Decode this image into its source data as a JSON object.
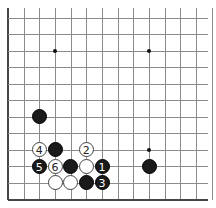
{
  "board": {
    "visible_region": "lower-left corner of 19x19 board",
    "cols_visible": 13,
    "rows_visible": 12,
    "first_row": 7,
    "origin_x": 8,
    "origin_y": 18,
    "spacing_x": 15.67,
    "spacing_y": 16.45,
    "star_points": [
      [
        3,
        9
      ],
      [
        9,
        9
      ],
      [
        9,
        15
      ]
    ],
    "colors": {
      "line": "#8a8a8a",
      "edge": "#444444",
      "black": "#1a1a1a",
      "white": "#ffffff"
    }
  },
  "stones": [
    {
      "col": 2,
      "row": 13,
      "color": "black",
      "label": ""
    },
    {
      "col": 2,
      "row": 15,
      "color": "white",
      "label": "4"
    },
    {
      "col": 3,
      "row": 15,
      "color": "black",
      "label": ""
    },
    {
      "col": 5,
      "row": 15,
      "color": "white",
      "label": "2"
    },
    {
      "col": 2,
      "row": 16,
      "color": "black",
      "label": "5"
    },
    {
      "col": 3,
      "row": 16,
      "color": "white",
      "label": "6"
    },
    {
      "col": 4,
      "row": 16,
      "color": "black",
      "label": ""
    },
    {
      "col": 5,
      "row": 16,
      "color": "white",
      "label": ""
    },
    {
      "col": 6,
      "row": 16,
      "color": "black",
      "label": "1"
    },
    {
      "col": 3,
      "row": 17,
      "color": "white",
      "label": ""
    },
    {
      "col": 4,
      "row": 17,
      "color": "white",
      "label": ""
    },
    {
      "col": 5,
      "row": 17,
      "color": "black",
      "label": ""
    },
    {
      "col": 6,
      "row": 17,
      "color": "black",
      "label": "3"
    },
    {
      "col": 9,
      "row": 16,
      "color": "black",
      "label": ""
    }
  ]
}
